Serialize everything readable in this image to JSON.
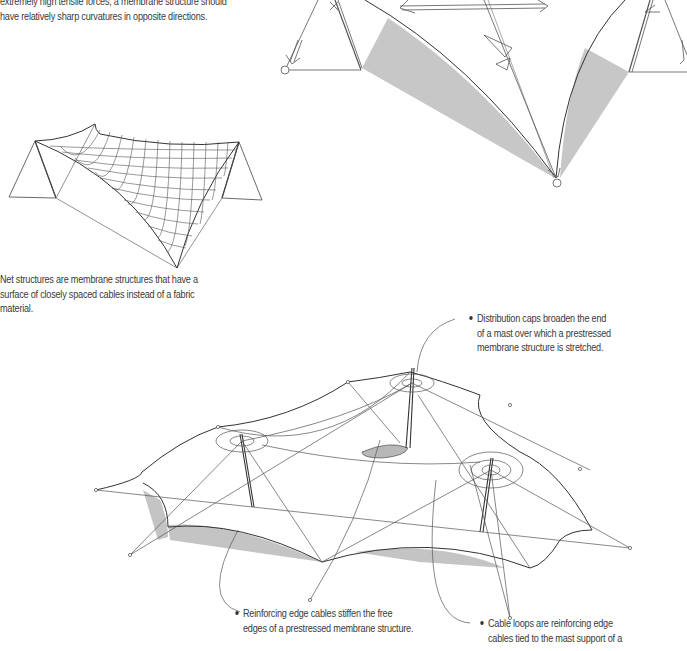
{
  "page": {
    "background": "#ffffff",
    "text_color": "#3a3a3a",
    "shade_color": "#c4c4c4"
  },
  "intro_paragraph": {
    "lines": [
      "extremely high tensile forces, a membrane structure should",
      "have relatively sharp curvatures in opposite directions."
    ]
  },
  "net_structure_caption": {
    "lines": [
      "Net structures are membrane structures that have a",
      "surface of closely spaced cables instead of a fabric",
      "material."
    ]
  },
  "callouts": [
    {
      "id": "distribution-caps",
      "lines": [
        "Distribution caps broaden the end",
        "of a mast over which a prestressed",
        "membrane structure is stretched."
      ]
    },
    {
      "id": "reinforcing-edge-cables",
      "lines": [
        "Reinforcing edge cables stiffen the free",
        "edges of a prestressed membrane structure."
      ]
    },
    {
      "id": "cable-loops",
      "lines": [
        "Cable loops are reinforcing edge",
        "cables tied to the mast support of a"
      ]
    }
  ],
  "figures": [
    {
      "id": "membrane-force-diagram",
      "description": "Saddle membrane with masts, anchor points and tension force arrows; shaded curvature regions"
    },
    {
      "id": "net-structure-drawing",
      "description": "Cable net saddle between two triangular mast frames"
    },
    {
      "id": "multi-mast-tent-drawing",
      "description": "Prestressed membrane with three masts, distribution caps, cable loops and shaded reinforced edges"
    }
  ]
}
